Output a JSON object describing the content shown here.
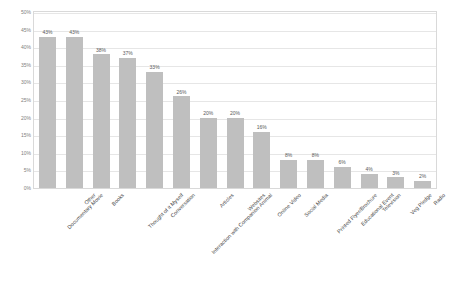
{
  "chart_data": {
    "type": "bar",
    "title": "",
    "subtitle": "",
    "xlabel": "",
    "ylabel": "",
    "ylim": [
      0,
      0.5
    ],
    "grid": true,
    "legend": "none",
    "ytick_labels": [
      "50%",
      "45%",
      "40%",
      "35%",
      "30%",
      "25%",
      "20%",
      "15%",
      "10%",
      "5%",
      "0%"
    ],
    "ytick_values": [
      0.5,
      0.45,
      0.4,
      0.35,
      0.3,
      0.25,
      0.2,
      0.15,
      0.1,
      0.05,
      0.0
    ],
    "categories": [
      "Documentary Movie",
      "Other",
      "Books",
      "Thought of it Myself",
      "Conversation",
      "Interaction with Companion Animal",
      "Articles",
      "Websites",
      "Online Video",
      "Social Media",
      "Printed Flyer/Brochure",
      "Educational Event",
      "Television",
      "Veg Pledge",
      "Radio"
    ],
    "values": [
      0.43,
      0.43,
      0.38,
      0.37,
      0.33,
      0.26,
      0.2,
      0.2,
      0.16,
      0.08,
      0.08,
      0.06,
      0.04,
      0.03,
      0.02
    ],
    "data_labels": [
      "43%",
      "43%",
      "38%",
      "37%",
      "33%",
      "26%",
      "20%",
      "20%",
      "16%",
      "8%",
      "8%",
      "6%",
      "4%",
      "3%",
      "2%"
    ],
    "bar_color": "#bfbfbf",
    "grid_color": "#e6e6e6",
    "frame_color": "#d9d9d9",
    "label_color": "#595959"
  }
}
